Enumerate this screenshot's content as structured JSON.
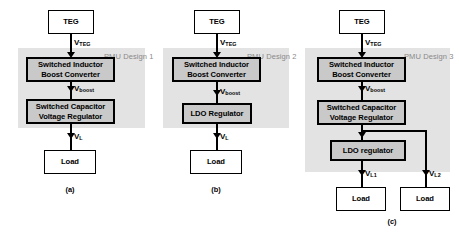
{
  "figure": {
    "colors": {
      "pmu_shade": "#e3e3e3",
      "block_fill": "#c9c9c9",
      "terminal_fill": "#ffffff",
      "stroke": "#000000",
      "pmu_label_color": "#8a8a8a"
    }
  },
  "panels": [
    {
      "id": "a",
      "caption": "(a)",
      "pmu_label_line1": "PMU",
      "pmu_label_line2": "Design 1",
      "source": {
        "label": "TEG"
      },
      "blocks": [
        {
          "line1": "Switched Inductor",
          "line2": "Boost Converter"
        },
        {
          "line1": "Switched Capacitor",
          "line2": "Voltage Regulator"
        }
      ],
      "loads": [
        {
          "label": "Load"
        }
      ],
      "signals": [
        {
          "name": "V",
          "sub": "TEG"
        },
        {
          "name": "V",
          "sub": "boost"
        },
        {
          "name": "V",
          "sub": "L"
        }
      ]
    },
    {
      "id": "b",
      "caption": "(b)",
      "pmu_label_line1": "PMU",
      "pmu_label_line2": "Design 2",
      "source": {
        "label": "TEG"
      },
      "blocks": [
        {
          "line1": "Switched Inductor",
          "line2": "Boost Converter"
        },
        {
          "line1": "LDO Regulator",
          "line2": ""
        }
      ],
      "loads": [
        {
          "label": "Load"
        }
      ],
      "signals": [
        {
          "name": "V",
          "sub": "TEG"
        },
        {
          "name": "V",
          "sub": "boost"
        },
        {
          "name": "V",
          "sub": "L"
        }
      ]
    },
    {
      "id": "c",
      "caption": "(c)",
      "pmu_label_line1": "PMU",
      "pmu_label_line2": "Design 3",
      "source": {
        "label": "TEG"
      },
      "blocks": [
        {
          "line1": "Switched Inductor",
          "line2": "Boost Converter"
        },
        {
          "line1": "Switched Capacitor",
          "line2": "Voltage Regulator"
        },
        {
          "line1": "LDO regulator",
          "line2": ""
        }
      ],
      "loads": [
        {
          "label": "Load"
        },
        {
          "label": "Load"
        }
      ],
      "signals": [
        {
          "name": "V",
          "sub": "TEG"
        },
        {
          "name": "V",
          "sub": "boost"
        },
        {
          "name": "V",
          "sub": "L1"
        },
        {
          "name": "V",
          "sub": "L2"
        }
      ]
    }
  ]
}
